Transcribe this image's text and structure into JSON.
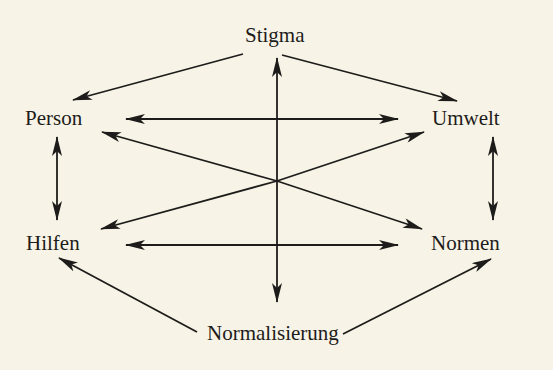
{
  "diagram": {
    "type": "concept-relationship-diagram",
    "colors": {
      "background": "#f7f4e7",
      "ink": "#1e1c1a"
    },
    "nodes": {
      "stigma": "Stigma",
      "person": "Person",
      "umwelt": "Umwelt",
      "hilfen": "Hilfen",
      "normen": "Normen",
      "normalisierung": "Normalisierung"
    },
    "edges": [
      {
        "from": "Stigma",
        "to": "Person",
        "direction": "one-way"
      },
      {
        "from": "Stigma",
        "to": "Umwelt",
        "direction": "one-way"
      },
      {
        "from": "Person",
        "to": "Umwelt",
        "direction": "bidirectional"
      },
      {
        "from": "Person",
        "to": "Hilfen",
        "direction": "bidirectional"
      },
      {
        "from": "Umwelt",
        "to": "Normen",
        "direction": "bidirectional"
      },
      {
        "from": "Hilfen",
        "to": "Normen",
        "direction": "bidirectional"
      },
      {
        "from": "Center",
        "to": "Stigma",
        "direction": "one-way"
      },
      {
        "from": "Center",
        "to": "Normalisierung",
        "direction": "one-way"
      },
      {
        "from": "Center",
        "to": "Person",
        "direction": "one-way"
      },
      {
        "from": "Center",
        "to": "Umwelt",
        "direction": "one-way"
      },
      {
        "from": "Center",
        "to": "Hilfen",
        "direction": "one-way"
      },
      {
        "from": "Center",
        "to": "Normen",
        "direction": "one-way"
      },
      {
        "from": "Normalisierung",
        "to": "Hilfen",
        "direction": "one-way"
      },
      {
        "from": "Normalisierung",
        "to": "Normen",
        "direction": "one-way"
      }
    ]
  }
}
